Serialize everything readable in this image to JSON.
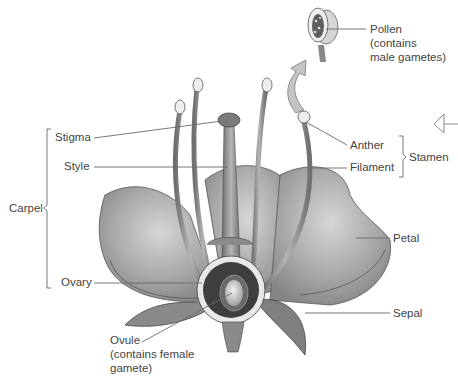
{
  "diagram": {
    "labels": {
      "pollen": "Pollen",
      "pollen_note_1": "(contains",
      "pollen_note_2": "male gametes)",
      "stigma": "Stigma",
      "style": "Style",
      "carpel": "Carpel",
      "ovary": "Ovary",
      "anther": "Anther",
      "filament": "Filament",
      "stamen": "Stamen",
      "petal": "Petal",
      "sepal": "Sepal",
      "ovule": "Ovule",
      "ovule_note_1": "(contains female",
      "ovule_note_2": "gamete)"
    },
    "groups": {
      "carpel": [
        "Stigma",
        "Style",
        "Ovary"
      ],
      "stamen": [
        "Anther",
        "Filament"
      ]
    },
    "icons": [
      "enlargement-arrow-icon",
      "back-arrow-icon"
    ],
    "colors": {
      "line": "#6a6a6a",
      "text": "#444444",
      "petal": "#9a9a9a",
      "dark": "#3a3a3a"
    }
  }
}
